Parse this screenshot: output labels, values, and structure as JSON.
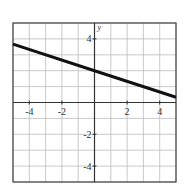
{
  "chart_data": {
    "type": "line",
    "title": "",
    "xlabel": "",
    "ylabel": "y",
    "xlim": [
      -5,
      5
    ],
    "ylim": [
      -5,
      5
    ],
    "grid": true,
    "x_ticks": [
      -4,
      -2,
      2,
      4
    ],
    "y_ticks": [
      4,
      -2,
      -4
    ],
    "x_tick_labels": [
      "-4",
      "-2",
      "2",
      "4"
    ],
    "y_tick_labels": [
      "4",
      "-2",
      "-4"
    ],
    "series": [
      {
        "name": "line",
        "equation": "y = -x/3 + 2",
        "x": [
          -5,
          0,
          5
        ],
        "y": [
          3.67,
          2,
          0.33
        ]
      }
    ],
    "colors": {
      "line": "#111111",
      "grid": "#bbbbbb",
      "axis": "#333333",
      "border": "#444444"
    }
  }
}
